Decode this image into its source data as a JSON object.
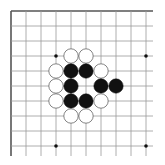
{
  "diagram": {
    "type": "go-board-corner",
    "corner": "top-left",
    "grid": {
      "lines": 10,
      "origin": 11,
      "spacing": 15,
      "extend_right": 153,
      "extend_bottom": 156,
      "line_color": "#9a9a9a",
      "border_color": "#555555"
    },
    "star_points": [
      {
        "col": 3,
        "row": 3
      },
      {
        "col": 9,
        "row": 3
      },
      {
        "col": 3,
        "row": 9
      },
      {
        "col": 9,
        "row": 9
      }
    ],
    "stones": [
      {
        "color": "white",
        "col": 4,
        "row": 3
      },
      {
        "color": "white",
        "col": 5,
        "row": 3
      },
      {
        "color": "white",
        "col": 3,
        "row": 4
      },
      {
        "color": "black",
        "col": 4,
        "row": 4
      },
      {
        "color": "black",
        "col": 5,
        "row": 4
      },
      {
        "color": "white",
        "col": 6,
        "row": 4
      },
      {
        "color": "white",
        "col": 3,
        "row": 5
      },
      {
        "color": "black",
        "col": 4,
        "row": 5
      },
      {
        "color": "black",
        "col": 6,
        "row": 5
      },
      {
        "color": "black",
        "col": 7,
        "row": 5
      },
      {
        "color": "white",
        "col": 3,
        "row": 6
      },
      {
        "color": "black",
        "col": 4,
        "row": 6
      },
      {
        "color": "black",
        "col": 5,
        "row": 6
      },
      {
        "color": "white",
        "col": 6,
        "row": 6
      },
      {
        "color": "white",
        "col": 4,
        "row": 7
      },
      {
        "color": "white",
        "col": 5,
        "row": 7
      }
    ],
    "colors": {
      "black_stone": "#111111",
      "white_stone": "#ffffff",
      "white_stone_edge": "#666666",
      "star_point": "#111111"
    }
  }
}
